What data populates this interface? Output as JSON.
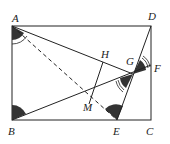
{
  "diagram": {
    "type": "geometry",
    "points": {
      "A": {
        "label": "A",
        "x": 12,
        "y": 26
      },
      "B": {
        "label": "B",
        "x": 12,
        "y": 120
      },
      "C": {
        "label": "C",
        "x": 151,
        "y": 120
      },
      "D": {
        "label": "D",
        "x": 151,
        "y": 26
      },
      "E": {
        "label": "E",
        "x": 117,
        "y": 120
      },
      "F": {
        "label": "F",
        "x": 151,
        "y": 65
      },
      "G": {
        "label": "G",
        "x": 133,
        "y": 74
      },
      "H": {
        "label": "H",
        "x": 103,
        "y": 62
      },
      "M": {
        "label": "M",
        "x": 90,
        "y": 100
      }
    },
    "segments": [
      {
        "from": "A",
        "to": "D",
        "style": "solid"
      },
      {
        "from": "D",
        "to": "C",
        "style": "solid"
      },
      {
        "from": "C",
        "to": "B",
        "style": "solid"
      },
      {
        "from": "B",
        "to": "A",
        "style": "solid"
      },
      {
        "from": "A",
        "to": "G",
        "style": "solid"
      },
      {
        "from": "D",
        "to": "E",
        "style": "solid"
      },
      {
        "from": "B",
        "to": "F",
        "style": "solid"
      },
      {
        "from": "A",
        "to": "E",
        "style": "dashed"
      },
      {
        "from": "H",
        "to": "M",
        "style": "solid"
      }
    ],
    "angle_marks": [
      {
        "at": "A",
        "style": "filled-with-arc"
      },
      {
        "at": "B",
        "style": "filled"
      },
      {
        "at": "E",
        "style": "filled"
      },
      {
        "at": "G",
        "style": "filled-double-arc"
      },
      {
        "at": "F",
        "style": "double-arc"
      }
    ],
    "colors": {
      "line": "#222222",
      "fill": "#333333",
      "background": "#ffffff"
    }
  }
}
